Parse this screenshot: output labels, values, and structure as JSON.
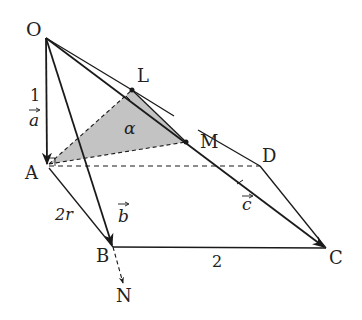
{
  "diagram": {
    "colors": {
      "stroke": "#1a1a1a",
      "shade": "#bdbdbd",
      "background": "#ffffff"
    },
    "points": {
      "O": {
        "label": "O",
        "x": 46,
        "y": 38
      },
      "A": {
        "label": "A",
        "x": 47,
        "y": 166
      },
      "B": {
        "label": "B",
        "x": 113,
        "y": 247
      },
      "C": {
        "label": "C",
        "x": 326,
        "y": 248
      },
      "D": {
        "label": "D",
        "x": 260,
        "y": 166
      },
      "L": {
        "label": "L",
        "x": 132,
        "y": 90
      },
      "M": {
        "label": "M",
        "x": 186,
        "y": 142
      },
      "N": {
        "label": "N",
        "x": 123,
        "y": 285
      }
    },
    "labels": {
      "O": "O",
      "A": "A",
      "B": "B",
      "C": "C",
      "D": "D",
      "L": "L",
      "M": "M",
      "N": "N",
      "alpha": "α",
      "edge_OA": "1",
      "vec_a": "a",
      "edge_AB": "2r",
      "vec_b": "b",
      "vec_c": "c",
      "edge_BC": "2"
    }
  }
}
